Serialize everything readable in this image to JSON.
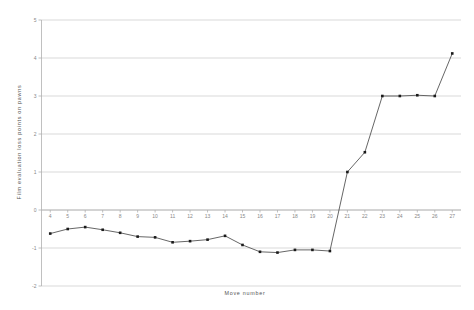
{
  "chart_data": {
    "type": "line",
    "title": "",
    "xlabel": "Move number",
    "ylabel": "Film evaluation loss points on pawns",
    "xlim": [
      3.5,
      27.5
    ],
    "ylim": [
      -2,
      5
    ],
    "grid": true,
    "legend": false,
    "legend_position": "none",
    "x_tick_labels": [
      "4",
      "5",
      "6",
      "7",
      "8",
      "9",
      "10",
      "11",
      "12",
      "13",
      "14",
      "15",
      "16",
      "17",
      "18",
      "19",
      "20",
      "21",
      "22",
      "23",
      "24",
      "25",
      "26",
      "27"
    ],
    "y_tick_labels": [
      "-2",
      "-1",
      "0",
      "1",
      "2",
      "3",
      "4",
      "5"
    ],
    "y_ticks": [
      -2,
      -1,
      0,
      1,
      2,
      3,
      4,
      5
    ],
    "x": [
      4,
      5,
      6,
      7,
      8,
      9,
      10,
      11,
      12,
      13,
      14,
      15,
      16,
      17,
      18,
      19,
      20,
      21,
      22,
      23,
      24,
      25,
      26,
      27
    ],
    "values": [
      -0.62,
      -0.5,
      -0.45,
      -0.52,
      -0.6,
      -0.7,
      -0.72,
      -0.85,
      -0.82,
      -0.78,
      -0.68,
      -0.92,
      -1.1,
      -1.12,
      -1.05,
      -1.05,
      -1.08,
      1.0,
      1.52,
      3.0,
      3.0,
      3.02,
      3.0,
      4.12
    ],
    "marker": "filled-square",
    "line_color": "#4a4a4a",
    "marker_color": "#1a1a1a",
    "grid_color": "#c9c9c9",
    "background_color": "#ffffff"
  },
  "axes": {
    "x_title": "Move number",
    "y_title": "Film evaluation loss points on pawns"
  }
}
